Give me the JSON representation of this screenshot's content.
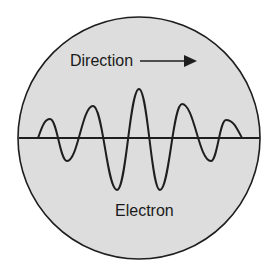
{
  "diagram": {
    "type": "electron-wave-packet",
    "labels": {
      "direction": "Direction",
      "electron": "Electron"
    },
    "colors": {
      "background": "#ffffff",
      "circle_fill": "#dddddd",
      "stroke": "#1e1e1e",
      "text": "#1a1a1a"
    },
    "circle": {
      "cx": 139,
      "cy": 138,
      "r": 121
    },
    "baseline": {
      "x1": 19,
      "x2": 260,
      "y": 138
    },
    "arrow": {
      "x1": 140,
      "x2": 197,
      "y": 61,
      "direction": "right"
    },
    "wave": {
      "start": [
        38,
        138
      ],
      "points": [
        {
          "kind": "peak",
          "x": 50,
          "y": 119
        },
        {
          "kind": "trough",
          "x": 67,
          "y": 161
        },
        {
          "kind": "peak",
          "x": 93,
          "y": 106
        },
        {
          "kind": "trough",
          "x": 117,
          "y": 190
        },
        {
          "kind": "peak",
          "x": 139,
          "y": 89
        },
        {
          "kind": "trough",
          "x": 160,
          "y": 190
        },
        {
          "kind": "peak",
          "x": 182,
          "y": 104
        },
        {
          "kind": "trough",
          "x": 211,
          "y": 161
        },
        {
          "kind": "peak",
          "x": 226,
          "y": 120
        }
      ],
      "end": [
        242,
        138
      ]
    }
  }
}
